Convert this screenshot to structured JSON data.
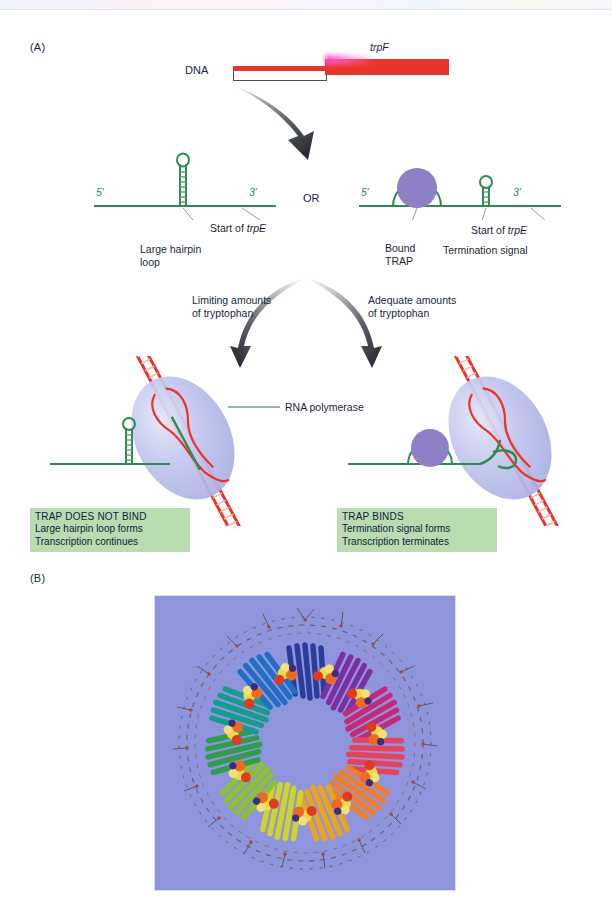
{
  "figure": {
    "panel_a_label": "(A)",
    "panel_b_label": "(B)"
  },
  "panel_a": {
    "dna_label": "DNA",
    "gene_label": "trpF",
    "or_label": "OR",
    "rna_left": {
      "five_prime": "5′",
      "three_prime": "3′",
      "start_label_prefix": "Start of ",
      "start_label_gene": "trpE",
      "hairpin_label_line1": "Large hairpin",
      "hairpin_label_line2": "loop"
    },
    "rna_right": {
      "five_prime": "5′",
      "three_prime": "3′",
      "start_label_prefix": "Start of ",
      "start_label_gene": "trpE",
      "trap_label_line1": "Bound",
      "trap_label_line2": "TRAP",
      "termination_label": "Termination signal"
    },
    "branch_left": {
      "line1": "Limiting amounts",
      "line2": "of tryptophan"
    },
    "branch_right": {
      "line1": "Adequate amounts",
      "line2": "of tryptophan"
    },
    "polymerase_label": "RNA polymerase",
    "outcome_left": {
      "headline": "TRAP DOES NOT BIND",
      "line2": "Large hairpin loop forms",
      "line3": "Transcription continues"
    },
    "outcome_right": {
      "headline": "TRAP BINDS",
      "line2": "Termination signal forms",
      "line3": "Transcription terminates"
    }
  },
  "icons": {
    "big_curved_arrow": "curved-arrow-icon",
    "branch_arrow_left": "branch-arrow-left-icon",
    "branch_arrow_right": "branch-arrow-right-icon",
    "hairpin_left": "rna-hairpin-icon",
    "hairpin_right": "rna-termination-hairpin-icon",
    "trap_circle": "trap-protein-circle-icon",
    "polymerase_left": "rna-polymerase-ellipse-icon",
    "polymerase_right": "rna-polymerase-ellipse-icon",
    "trap_ring_structure": "trap-ring-structure-image"
  },
  "colors": {
    "dna_red": "#e8342a",
    "promoter_pink": "#ff4fd0",
    "rna_green": "#2e8b4f",
    "trap_purple": "#8f7fc4",
    "polymerase_fill": "#b9bde8",
    "caption_box_green": "#b9dcb0",
    "panel_b_background": "#8e95dd",
    "text_navy": "#1b1f3b"
  }
}
